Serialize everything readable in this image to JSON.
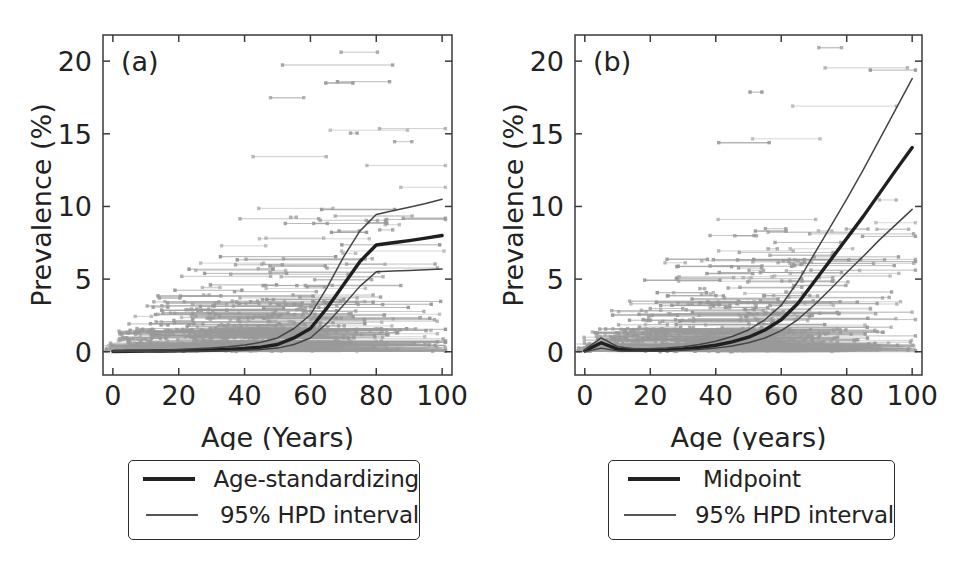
{
  "figure": {
    "panels": [
      {
        "id": "a",
        "label": "(a)",
        "xlabel": "Age (Years)",
        "ylabel": "Prevalence (%)",
        "legend": {
          "entries": [
            {
              "label": "Age-standardizing",
              "style": "thick"
            },
            {
              "label": "95% HPD interval",
              "style": "thin"
            }
          ]
        },
        "xticks": [
          "0",
          "20",
          "40",
          "60",
          "80",
          "100"
        ],
        "yticks": [
          "0",
          "5",
          "10",
          "15",
          "20"
        ]
      },
      {
        "id": "b",
        "label": "(b)",
        "xlabel": "Age (years)",
        "ylabel": "Prevalence (%)",
        "legend": {
          "entries": [
            {
              "label": "Midpoint",
              "style": "thick"
            },
            {
              "label": "95% HPD interval",
              "style": "thin"
            }
          ]
        },
        "xticks": [
          "0",
          "20",
          "40",
          "60",
          "80",
          "100"
        ],
        "yticks": [
          "0",
          "5",
          "10",
          "15",
          "20"
        ]
      }
    ]
  },
  "colors": {
    "curve": "#1f1f1f",
    "hpd": "#444444",
    "data": "#9a9a9a",
    "axis": "#3a3a3a",
    "background": "#ffffff"
  },
  "chart_data": [
    {
      "type": "line",
      "panel": "a",
      "title": "(a)",
      "xlabel": "Age (Years)",
      "ylabel": "Prevalence (%)",
      "xlim": [
        -3,
        103
      ],
      "ylim": [
        -1.6,
        21.8
      ],
      "xticks": [
        0,
        20,
        40,
        60,
        80,
        100
      ],
      "yticks": [
        0,
        5,
        10,
        15,
        20
      ],
      "grid": false,
      "legend_position": "below-axes",
      "x": [
        0,
        5,
        10,
        15,
        20,
        25,
        30,
        35,
        40,
        45,
        50,
        55,
        60,
        65,
        70,
        75,
        80,
        85,
        90,
        95,
        100
      ],
      "series": [
        {
          "name": "Age-standardizing",
          "style": "thick",
          "values": [
            0.02,
            0.03,
            0.04,
            0.05,
            0.07,
            0.09,
            0.12,
            0.16,
            0.22,
            0.32,
            0.5,
            0.95,
            1.6,
            3.0,
            4.6,
            6.2,
            7.35,
            7.5,
            7.65,
            7.82,
            8.0
          ]
        },
        {
          "name": "95% HPD upper",
          "style": "thin",
          "values": [
            0.06,
            0.08,
            0.1,
            0.12,
            0.15,
            0.2,
            0.26,
            0.34,
            0.46,
            0.65,
            0.95,
            1.6,
            2.55,
            4.4,
            6.5,
            8.3,
            9.45,
            9.7,
            9.95,
            10.2,
            10.5
          ]
        },
        {
          "name": "95% HPD lower",
          "style": "thin",
          "values": [
            0.0,
            0.01,
            0.01,
            0.02,
            0.03,
            0.04,
            0.05,
            0.07,
            0.1,
            0.15,
            0.25,
            0.5,
            0.95,
            1.95,
            3.2,
            4.5,
            5.5,
            5.55,
            5.6,
            5.65,
            5.7
          ]
        }
      ]
    },
    {
      "type": "line",
      "panel": "b",
      "title": "(b)",
      "xlabel": "Age (years)",
      "ylabel": "Prevalence (%)",
      "xlim": [
        -3,
        103
      ],
      "ylim": [
        -1.6,
        21.8
      ],
      "xticks": [
        0,
        20,
        40,
        60,
        80,
        100
      ],
      "yticks": [
        0,
        5,
        10,
        15,
        20
      ],
      "grid": false,
      "legend_position": "below-axes",
      "x": [
        0,
        5,
        10,
        15,
        20,
        25,
        30,
        35,
        40,
        45,
        50,
        55,
        60,
        65,
        70,
        75,
        80,
        85,
        90,
        95,
        100
      ],
      "series": [
        {
          "name": "Midpoint",
          "style": "thick",
          "values": [
            0.05,
            0.62,
            0.18,
            0.1,
            0.1,
            0.13,
            0.2,
            0.3,
            0.45,
            0.68,
            1.0,
            1.5,
            2.2,
            3.3,
            4.8,
            6.3,
            7.8,
            9.3,
            10.9,
            12.5,
            14.05
          ]
        },
        {
          "name": "95% HPD upper",
          "style": "thin",
          "values": [
            0.14,
            0.95,
            0.35,
            0.2,
            0.2,
            0.25,
            0.35,
            0.5,
            0.72,
            1.05,
            1.5,
            2.2,
            3.2,
            4.8,
            6.7,
            8.6,
            10.5,
            12.5,
            14.6,
            16.7,
            18.8
          ]
        },
        {
          "name": "95% HPD lower",
          "style": "thin",
          "values": [
            0.0,
            0.25,
            0.06,
            0.03,
            0.04,
            0.06,
            0.1,
            0.16,
            0.25,
            0.4,
            0.62,
            0.95,
            1.45,
            2.2,
            3.2,
            4.3,
            5.45,
            6.55,
            7.7,
            8.75,
            9.8
          ]
        }
      ],
      "observed_data_note": "Gray horizontal segments denote age-range data intervals with endpoint markers"
    }
  ]
}
